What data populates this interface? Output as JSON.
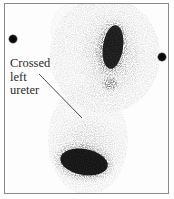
{
  "figure": {
    "type": "renal scintigraphy scan",
    "annotation": {
      "lines": [
        "Crossed",
        "left",
        "ureter"
      ]
    },
    "colors": {
      "background": "#ffffff",
      "tracer": "#111111",
      "border": "#8a8a8a",
      "label_text": "#2a2a2a"
    }
  }
}
